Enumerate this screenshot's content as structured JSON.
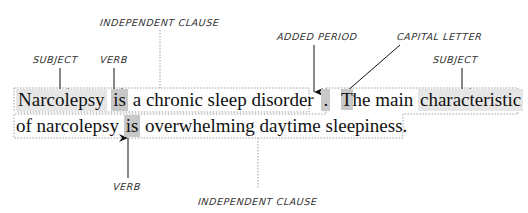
{
  "labels": {
    "top_clause": "INDEPENDENT CLAUSE",
    "subject_1": "SUBJECT",
    "verb_1": "VERB",
    "added_period": "ADDED PERIOD",
    "capital_letter": "CAPITAL LETTER",
    "subject_2": "SUBJECT",
    "verb_2": "VERB",
    "bottom_clause": "INDEPENDENT CLAUSE"
  },
  "sentence1": {
    "subject": "Narcolepsy",
    "verb": "is",
    "rest": "a chronic sleep disorder",
    "period": "."
  },
  "sentence2": {
    "capital": "T",
    "start": "he main",
    "subject": "characteristic",
    "line2_start": "of narcolepsy",
    "verb": "is",
    "rest": "overwhelming daytime sleepiness."
  },
  "colors": {
    "highlight_light": "#e6e6e6",
    "highlight_mid": "#c8c8c8",
    "border": "#a0a0a0",
    "text": "#111111"
  }
}
